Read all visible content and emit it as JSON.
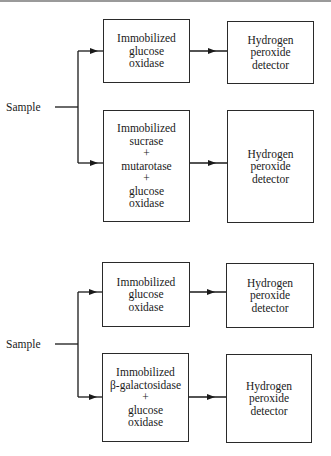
{
  "diagrams": [
    {
      "sample_label": "Sample",
      "sensors": [
        {
          "reactor_lines": [
            "Immobilized",
            "glucose",
            "oxidase"
          ],
          "detector_lines": [
            "Hydrogen",
            "peroxide",
            "detector"
          ]
        },
        {
          "reactor_lines": [
            "Immobilized",
            "sucrase",
            "+",
            "mutarotase",
            "+",
            "glucose",
            "oxidase"
          ],
          "detector_lines": [
            "Hydrogen",
            "peroxide",
            "detector"
          ]
        }
      ]
    },
    {
      "sample_label": "Sample",
      "sensors": [
        {
          "reactor_lines": [
            "Immobilized",
            "glucose",
            "oxidase"
          ],
          "detector_lines": [
            "Hydrogen",
            "peroxide",
            "detector"
          ]
        },
        {
          "reactor_lines": [
            "Immobilized",
            "β-galactosidase",
            "+",
            "glucose",
            "oxidase"
          ],
          "detector_lines": [
            "Hydrogen",
            "peroxide",
            "detector"
          ]
        }
      ]
    }
  ]
}
